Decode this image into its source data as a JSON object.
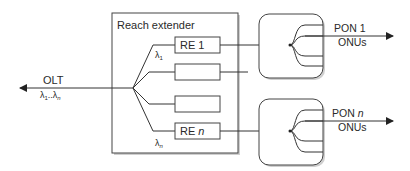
{
  "diagram": {
    "olt": {
      "label": "OLT",
      "wavelengths": "λ1..λn",
      "lambda_start": "λ",
      "sub_start": "1",
      "dots": "..",
      "lambda_end": "λ",
      "sub_end": "n"
    },
    "reach_extender": {
      "title": "Reach extender",
      "branch_top_label": {
        "lambda": "λ",
        "sub": "1"
      },
      "branch_bottom_label": {
        "lambda": "λ",
        "sub": "n"
      },
      "units": [
        {
          "label": "RE 1",
          "prefix": "RE ",
          "suffix": "1"
        },
        {
          "label": "",
          "prefix": "",
          "suffix": ""
        },
        {
          "label": "",
          "prefix": "",
          "suffix": ""
        },
        {
          "label": "RE n",
          "prefix": "RE ",
          "suffix": "n"
        }
      ]
    },
    "pons": [
      {
        "label_line1": "PON 1",
        "pon_prefix": "PON ",
        "pon_index": "1",
        "label_line2": "ONUs"
      },
      {
        "label_line1": "PON n",
        "pon_prefix": "PON ",
        "pon_index": "n",
        "label_line2": "ONUs"
      }
    ]
  }
}
